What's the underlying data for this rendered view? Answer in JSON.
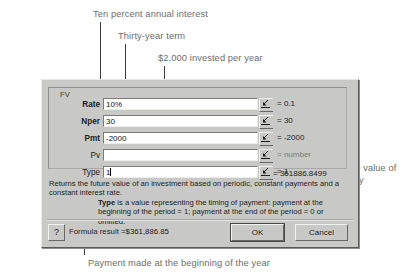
{
  "annotations": [
    {
      "id": "rate",
      "text": "Ten percent annual interest"
    },
    {
      "id": "nper",
      "text": "Thirty-year term"
    },
    {
      "id": "pmt",
      "text": "$2,000 invested per year"
    },
    {
      "id": "fv",
      "text": "Future value of annuity"
    },
    {
      "id": "type",
      "text": "Payment made at the beginning of the year"
    }
  ],
  "dialog": {
    "group_title": "FV",
    "arguments": [
      {
        "label": "Rate",
        "required": true,
        "value": "10%",
        "result": "= 0.1",
        "dim": false,
        "caret": false
      },
      {
        "label": "Nper",
        "required": true,
        "value": "30",
        "result": "= 30",
        "dim": false,
        "caret": false
      },
      {
        "label": "Pmt",
        "required": true,
        "value": "-2000",
        "result": "= -2000",
        "dim": false,
        "caret": false
      },
      {
        "label": "Pv",
        "required": false,
        "value": "",
        "result": "= number",
        "dim": true,
        "caret": false
      },
      {
        "label": "Type",
        "required": false,
        "value": "1",
        "result": "= 1",
        "dim": false,
        "caret": true
      }
    ],
    "function_result": "= 361886.8499",
    "description": "Returns the future value of an investment based on periodic, constant payments and a constant interest rate.",
    "argument_help_name": "Type",
    "argument_help_text": " is a value representing the timing of payment: payment at the beginning of the period = 1; payment at the end of the period = 0 or omitted.",
    "formula_result_label": "Formula result =",
    "formula_result_value": "$361,886.85",
    "help_button": "?",
    "ok_label": "OK",
    "cancel_label": "Cancel"
  },
  "colors": {
    "dialog_face": "#c8c8c6",
    "annotation_text": "#6d6d6d",
    "leader_line": "#3a3a3a",
    "field_bg": "#ffffff",
    "dim_text": "#7c7c7a"
  }
}
